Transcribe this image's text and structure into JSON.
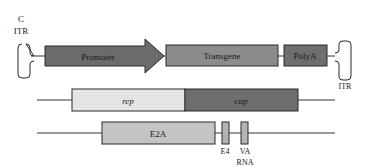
{
  "diagram": {
    "colors": {
      "promoter": "#6b6b6b",
      "transgene": "#8c8c8c",
      "polya": "#6e6e6e",
      "rep": "#e4e4e4",
      "cap": "#6e6e6e",
      "e2a": "#c4c4c4",
      "e4": "#b4b4b4",
      "va": "#b4b4b4",
      "line": "#333333",
      "stroke": "#2a2a2a"
    },
    "rows": [
      {
        "name": "vector-plasmid",
        "left_itr": {
          "label_top": "C",
          "label": "ITR"
        },
        "elements": [
          {
            "id": "promoter",
            "label": "Promoter",
            "shape": "arrow"
          },
          {
            "id": "transgene",
            "label": "Transgene",
            "shape": "box"
          },
          {
            "id": "polya",
            "label": "PolyA",
            "shape": "box"
          }
        ],
        "right_itr": {
          "label": "ITR"
        }
      },
      {
        "name": "rep-cap-plasmid",
        "elements": [
          {
            "id": "rep",
            "label": "rep",
            "italic": true
          },
          {
            "id": "cap",
            "label": "cap",
            "italic": true
          }
        ]
      },
      {
        "name": "helper-plasmid",
        "elements": [
          {
            "id": "e2a",
            "label": "E2A"
          },
          {
            "id": "e4",
            "label": "E4"
          },
          {
            "id": "va",
            "label_line1": "VA",
            "label_line2": "RNA"
          }
        ]
      }
    ]
  }
}
